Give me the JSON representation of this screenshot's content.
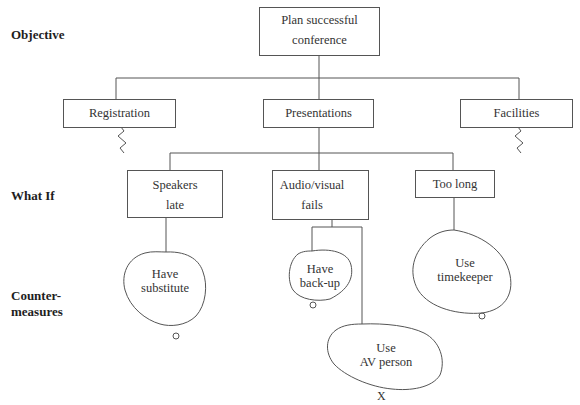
{
  "row_labels": {
    "objective": "Objective",
    "what_if": "What If",
    "countermeasures_line1": "Counter-",
    "countermeasures_line2": "measures"
  },
  "objective": {
    "line1": "Plan successful",
    "line2": "conference"
  },
  "subgoals": [
    {
      "label": "Registration",
      "expanded": false
    },
    {
      "label": "Presentations",
      "expanded": true
    },
    {
      "label": "Facilities",
      "expanded": false
    }
  ],
  "what_if": [
    {
      "line1": "Speakers",
      "line2": "late"
    },
    {
      "line1": "Audio/visual",
      "line2": "fails"
    },
    {
      "line1": "Too long",
      "line2": ""
    }
  ],
  "countermeasures": [
    {
      "line1": "Have",
      "line2": "substitute",
      "mark": "○",
      "mark_meaning": "feasible"
    },
    {
      "line1": "Have",
      "line2": "back-up",
      "mark": "○",
      "mark_meaning": "feasible"
    },
    {
      "line1": "Use",
      "line2": "AV person",
      "mark": "X",
      "mark_meaning": "not feasible"
    },
    {
      "line1": "Use",
      "line2": "timekeeper",
      "mark": "○",
      "mark_meaning": "feasible"
    }
  ],
  "colors": {
    "line": "#555555",
    "text": "#333333",
    "background": "#ffffff"
  }
}
